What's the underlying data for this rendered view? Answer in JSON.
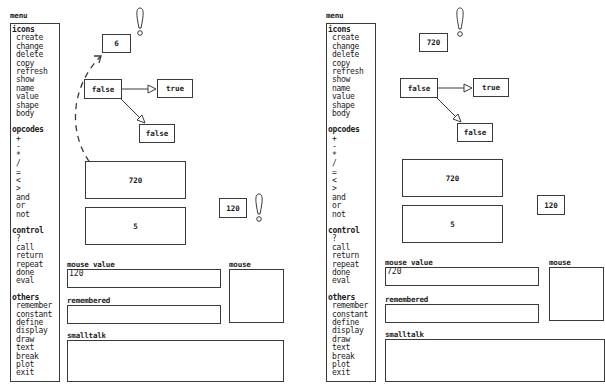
{
  "menu": {
    "title": "menu",
    "groups": [
      {
        "heading": "icons",
        "items": [
          "create",
          "change",
          "delete",
          "copy",
          "refresh",
          "show",
          "name",
          "value",
          "shape",
          "body"
        ]
      },
      {
        "heading": "opcodes",
        "items": [
          "+",
          "-",
          "*",
          "/",
          "=",
          "<",
          ">",
          "and",
          "or",
          "not"
        ]
      },
      {
        "heading": "control",
        "items": [
          "?",
          "call",
          "return",
          "repeat",
          "done",
          "eval"
        ]
      },
      {
        "heading": "others",
        "items": [
          "remember",
          "constant",
          "define",
          "display",
          "draw",
          "text",
          "break",
          "plot",
          "exit"
        ]
      }
    ]
  },
  "panels": [
    {
      "top_value_box": "6",
      "graph": {
        "root": "false",
        "true_branch": "true",
        "false_branch": "false"
      },
      "stack": [
        "720",
        "5"
      ],
      "result_box": "120",
      "fields": {
        "mouse_value_label": "mouse value",
        "mouse_value": "120",
        "remembered_label": "remembered",
        "remembered": "",
        "smalltalk_label": "smalltalk",
        "smalltalk": "",
        "mouse_label": "mouse"
      }
    },
    {
      "top_value_box": "720",
      "graph": {
        "root": "false",
        "true_branch": "true",
        "false_branch": "false"
      },
      "stack": [
        "720",
        "5"
      ],
      "result_box": "120",
      "fields": {
        "mouse_value_label": "mouse value",
        "mouse_value": "720",
        "remembered_label": "remembered",
        "remembered": "",
        "smalltalk_label": "smalltalk",
        "smalltalk": "",
        "mouse_label": "mouse"
      }
    }
  ],
  "icons": {
    "alert": "exclamation-icon",
    "arrow": "hollow-triangle-arrow",
    "drag_path": "dashed-arc"
  }
}
